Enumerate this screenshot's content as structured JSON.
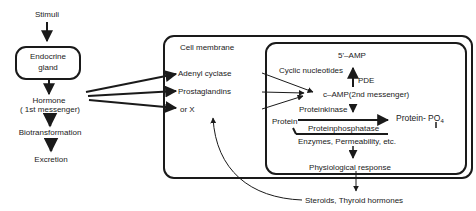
{
  "left_chain": {
    "stimuli": "Stimuli",
    "gland_line1": "Endocrine",
    "gland_line2": "gland",
    "hormone_line1": "Hormone",
    "hormone_line2": "( 1st messenger)",
    "biotransformation": "Biotransformation",
    "excretion": "Excretion"
  },
  "cell": {
    "membrane_label": "Cell membrane",
    "receptors": [
      "Adenyl cyclase",
      "Prostaglandins",
      "or X"
    ]
  },
  "inner": {
    "five_amp": "5'–AMP",
    "cyclic_nucleotides": "Cyclic nucleotides",
    "pde": "PDE",
    "camp": "c–AMP(2nd messenger)",
    "proteinkinase": "Proteinkinase",
    "protein": "Protein",
    "protein_po4": "Protein- PO",
    "po4_sub": "4",
    "proteinphosphatase": "Proteinphosphatase",
    "enzymes": "Enzymes, Permeability, etc.",
    "physiological_response": "Physiological response"
  },
  "external": {
    "steroids": "Steroids, Thyroid hormones"
  }
}
